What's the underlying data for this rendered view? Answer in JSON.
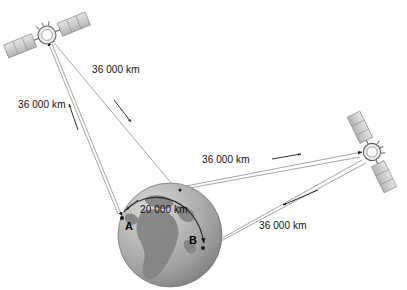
{
  "diagram": {
    "background_color": "#ffffff",
    "line_color": "#9a9a9a",
    "arrow_color": "#1a1a1a",
    "text_color": "#111111"
  },
  "labels": {
    "sat1_to_earth_left": "36 000 km",
    "earth_to_sat1_right": "36 000 km",
    "earth_to_sat2": "36 000 km",
    "sat2_to_earth": "36 000 km",
    "surface_arc": "20 000 km"
  },
  "points": {
    "a": "A",
    "b": "B"
  },
  "earth": {
    "name": "earth-globe",
    "center_x": 170,
    "center_y": 235,
    "radius": 52,
    "ocean_color": "#b9b9b9",
    "land_color": "#8e8e8e",
    "highlight_color": "#e4e4e4"
  },
  "satellites": [
    {
      "name": "satellite-upper-left",
      "x": 47,
      "y": 35,
      "rotation": -22
    },
    {
      "name": "satellite-right",
      "x": 372,
      "y": 152,
      "rotation": 64
    }
  ]
}
